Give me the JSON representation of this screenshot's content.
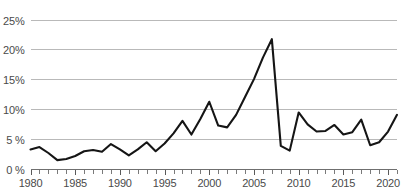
{
  "chart_data": {
    "type": "line",
    "title": "",
    "subtitle": "",
    "xlabel": "",
    "ylabel": "",
    "grid": "horizontal",
    "legend": "none",
    "xlim": [
      1980,
      2021
    ],
    "ylim": [
      0,
      25
    ],
    "y_tick_labels": [
      "25%",
      "20%",
      "15%",
      "10%",
      "5 %",
      "0 %"
    ],
    "y_tick_values": [
      25,
      20,
      15,
      10,
      5,
      0
    ],
    "x_tick_labels": [
      "1980",
      "1985",
      "1990",
      "1995",
      "2000",
      "2005",
      "2010",
      "2015",
      "2020"
    ],
    "x_tick_values": [
      1980,
      1985,
      1990,
      1995,
      2000,
      2005,
      2010,
      2015,
      2020
    ],
    "x_minor_tick_step": 1,
    "value_suffix": "%",
    "series": [
      {
        "name": "series-1",
        "color": "#151515",
        "x": [
          1980,
          1981,
          1982,
          1983,
          1984,
          1985,
          1986,
          1987,
          1988,
          1989,
          1990,
          1991,
          1992,
          1993,
          1994,
          1995,
          1996,
          1997,
          1998,
          1999,
          2000,
          2001,
          2002,
          2003,
          2004,
          2005,
          2006,
          2007,
          2008,
          2009,
          2010,
          2011,
          2012,
          2013,
          2014,
          2015,
          2016,
          2017,
          2018,
          2019,
          2020,
          2021
        ],
        "values": [
          3.2,
          3.6,
          2.6,
          1.4,
          1.6,
          2.1,
          2.9,
          3.1,
          2.8,
          4.1,
          3.2,
          2.2,
          3.2,
          4.4,
          2.9,
          4.2,
          5.9,
          8.0,
          5.7,
          8.3,
          11.2,
          7.2,
          6.9,
          9.0,
          12.0,
          15.0,
          18.6,
          21.7,
          3.8,
          3.0,
          9.4,
          7.4,
          6.2,
          6.3,
          7.3,
          5.7,
          6.1,
          8.2,
          3.9,
          4.4,
          6.2,
          9.0
        ]
      }
    ]
  },
  "axis": {
    "y_title": "",
    "x_title": ""
  }
}
